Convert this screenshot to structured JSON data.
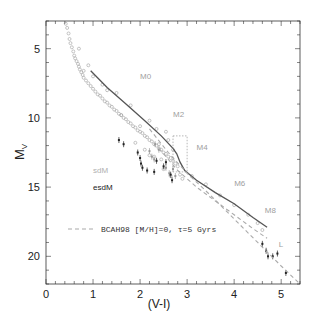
{
  "chart_data": {
    "type": "scatter",
    "title": "",
    "xlabel": "(V-I)",
    "ylabel": "M_V",
    "xlim": [
      0,
      5.4
    ],
    "ylim": [
      22.0,
      3.0
    ],
    "y_inverted": true,
    "grid": false,
    "x_ticks": [
      0,
      1,
      2,
      3,
      4,
      5
    ],
    "x_tick_labels": [
      "0",
      "1",
      "2",
      "3",
      "4",
      "5"
    ],
    "y_ticks": [
      5,
      10,
      15,
      20
    ],
    "y_tick_labels": [
      "5",
      "10",
      "15",
      "20"
    ],
    "annotations": [
      {
        "text": "M0",
        "x": 2.0,
        "y": 7.2,
        "color": "#a0a0a0"
      },
      {
        "text": "M2",
        "x": 2.7,
        "y": 9.9,
        "color": "#a0a0a0"
      },
      {
        "text": "M4",
        "x": 3.2,
        "y": 12.3,
        "color": "#a0a0a0"
      },
      {
        "text": "M6",
        "x": 4.0,
        "y": 14.9,
        "color": "#a0a0a0"
      },
      {
        "text": "M8",
        "x": 4.65,
        "y": 16.9,
        "color": "#a0a0a0"
      },
      {
        "text": "L",
        "x": 4.95,
        "y": 19.3,
        "color": "#a0a0a0"
      },
      {
        "text": "sdM",
        "x": 1.0,
        "y": 14.0,
        "color": "#b0b0b0"
      },
      {
        "text": "esdM",
        "x": 1.0,
        "y": 15.2,
        "color": "#222222"
      }
    ],
    "legend": {
      "position": "lower-left",
      "entries": [
        {
          "label": "BCAH98 [M/H]=0, τ=5 Gyrs",
          "style": "dashed",
          "color": "#aaaaaa"
        }
      ]
    },
    "series": [
      {
        "name": "Main sequence field stars",
        "kind": "scatter",
        "color": "#aaaaaa",
        "x": [
          0.42,
          0.45,
          0.48,
          0.5,
          0.52,
          0.55,
          0.58,
          0.6,
          0.62,
          0.65,
          0.68,
          0.7,
          0.72,
          0.75,
          0.78,
          0.8,
          0.85,
          0.9,
          0.95,
          1.0,
          1.05,
          1.1,
          1.15,
          1.2,
          1.25,
          1.3,
          1.35,
          1.4,
          1.45,
          1.5,
          1.55,
          1.6,
          1.65,
          1.7,
          1.75,
          1.8,
          1.85,
          1.9,
          1.95,
          2.0,
          2.05,
          2.1,
          2.15,
          2.2,
          2.25,
          2.3,
          2.35,
          2.4,
          2.45,
          2.5,
          2.55,
          2.6,
          2.65,
          2.7,
          2.75,
          2.8,
          0.7,
          0.9,
          1.2,
          1.5,
          1.8,
          2.0,
          2.2,
          2.4,
          2.6,
          2.3,
          2.5,
          2.1,
          1.9,
          2.7,
          2.9,
          3.1,
          3.4,
          3.7,
          4.0,
          4.3,
          4.5,
          4.6,
          0.8,
          1.0,
          1.3,
          1.6,
          2.2,
          2.45,
          2.65,
          2.85,
          2.55,
          2.35
        ],
        "y": [
          3.2,
          3.5,
          3.9,
          4.3,
          4.6,
          4.9,
          5.2,
          5.5,
          5.7,
          5.9,
          6.1,
          6.3,
          6.5,
          6.7,
          6.9,
          7.1,
          7.3,
          7.5,
          7.7,
          7.9,
          8.1,
          8.3,
          8.4,
          8.6,
          8.8,
          8.9,
          9.1,
          9.2,
          9.4,
          9.5,
          9.7,
          9.8,
          10.0,
          10.1,
          10.3,
          10.4,
          10.6,
          10.7,
          10.9,
          11.0,
          11.1,
          11.3,
          11.4,
          11.6,
          11.7,
          11.9,
          12.0,
          12.2,
          12.3,
          12.5,
          12.6,
          12.8,
          12.9,
          13.1,
          13.3,
          13.5,
          5.0,
          6.2,
          7.6,
          8.2,
          9.1,
          10.6,
          10.2,
          11.9,
          11.6,
          12.8,
          13.7,
          12.3,
          11.8,
          12.3,
          14.4,
          14.2,
          14.8,
          15.6,
          16.3,
          17.0,
          17.6,
          18.1,
          6.6,
          7.0,
          8.0,
          9.8,
          12.7,
          13.0,
          14.2,
          14.1,
          11.0,
          10.8
        ]
      },
      {
        "name": "sdM",
        "kind": "scatter_errorbar",
        "color": "#999999",
        "x": [
          2.2,
          2.25,
          2.3,
          2.32,
          2.4,
          2.55,
          2.62,
          2.7,
          2.75
        ],
        "y": [
          12.4,
          12.8,
          13.0,
          11.9,
          12.3,
          13.6,
          14.0,
          13.7,
          14.2
        ]
      },
      {
        "name": "esdM",
        "kind": "scatter_errorbar",
        "color": "#222222",
        "x": [
          1.55,
          1.65,
          1.95,
          2.0,
          2.02,
          2.05,
          2.15,
          2.3,
          2.35,
          2.5,
          2.55,
          2.65,
          2.68,
          4.6,
          4.68,
          4.72,
          4.82,
          4.92,
          5.1
        ],
        "y": [
          11.6,
          11.9,
          12.5,
          12.9,
          13.3,
          13.6,
          13.8,
          13.9,
          13.1,
          13.5,
          13.2,
          14.1,
          14.5,
          19.1,
          19.6,
          20.0,
          20.0,
          19.8,
          21.2
        ]
      },
      {
        "name": "Mean main sequence",
        "kind": "line",
        "color": "#555555",
        "x": [
          0.95,
          1.3,
          1.7,
          2.1,
          2.45,
          2.7,
          2.78,
          2.85,
          2.95,
          3.2,
          3.6,
          4.0,
          4.4,
          4.7
        ],
        "y": [
          6.6,
          7.8,
          9.0,
          10.2,
          11.3,
          12.2,
          12.6,
          13.2,
          13.8,
          14.5,
          15.4,
          16.2,
          17.2,
          17.9
        ]
      },
      {
        "name": "BCAH98 [M/H]=0, τ=5 Gyrs",
        "kind": "line_dashed",
        "color": "#aaaaaa",
        "x": [
          2.2,
          2.6,
          3.0,
          3.5,
          4.0,
          4.5,
          5.0,
          5.4
        ],
        "y": [
          10.8,
          12.5,
          14.0,
          15.6,
          17.3,
          19.0,
          20.7,
          22.0
        ]
      },
      {
        "name": "BCAH98 (lower metallicity)",
        "kind": "line_dashed",
        "color": "#aaaaaa",
        "x": [
          2.4,
          2.8,
          3.2,
          3.6,
          4.0,
          4.4,
          4.7
        ],
        "y": [
          12.2,
          13.8,
          15.0,
          16.0,
          17.0,
          18.0,
          18.7
        ]
      },
      {
        "name": "M4 region box",
        "kind": "box_dotted",
        "color": "#999999",
        "x": [
          2.7,
          3.0
        ],
        "y": [
          11.3,
          13.9
        ]
      }
    ]
  }
}
